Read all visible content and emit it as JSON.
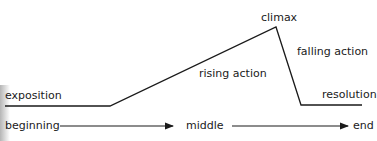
{
  "diagram": {
    "type": "plot-structure (Freytag's pyramid)",
    "plot_labels": {
      "exposition": "exposition",
      "rising_action": "rising action",
      "climax": "climax",
      "falling_action": "falling action",
      "resolution": "resolution"
    },
    "timeline_labels": {
      "beginning": "beginning",
      "middle": "middle",
      "end": "end"
    },
    "colors": {
      "line": "#1a1a1a",
      "text": "#1a1a1a",
      "background": "#ffffff"
    }
  }
}
